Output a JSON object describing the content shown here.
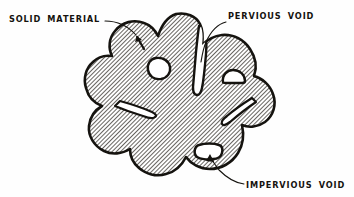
{
  "figure": {
    "background_color": "#fefefe",
    "ink_color": "#15130f",
    "hatch_color": "#3b3832",
    "void_fill": "#ffffff",
    "hatch_angle_deg": 45,
    "style": "hand-drawn ink hatching"
  },
  "labels": {
    "solid_material": {
      "text": "SOLID MATERIAL",
      "x": 9,
      "y": 22,
      "anchor": "start",
      "points_to": "hatched body"
    },
    "pervious_void": {
      "text": "PERVIOUS VOID",
      "x": 228,
      "y": 19,
      "anchor": "start",
      "points_to": "open vertical slit"
    },
    "impervious_void": {
      "text": "IMPERVIOUS VOID",
      "x": 246,
      "y": 188,
      "anchor": "start",
      "points_to": "enclosed white void"
    }
  },
  "features": {
    "solid_body": "irregular amoeba-like lobed mass, diagonally hatched",
    "enclosed_voids": [
      {
        "name": "upper-left void",
        "cx": 160,
        "cy": 68
      },
      {
        "name": "right dome void",
        "cx": 232,
        "cy": 77
      },
      {
        "name": "impervious void",
        "cx": 210,
        "cy": 152
      }
    ],
    "slits": [
      {
        "name": "pervious slit",
        "open_to_exterior": true
      },
      {
        "name": "left slit",
        "open_to_exterior": true
      },
      {
        "name": "right slit",
        "open_to_exterior": true
      }
    ]
  }
}
